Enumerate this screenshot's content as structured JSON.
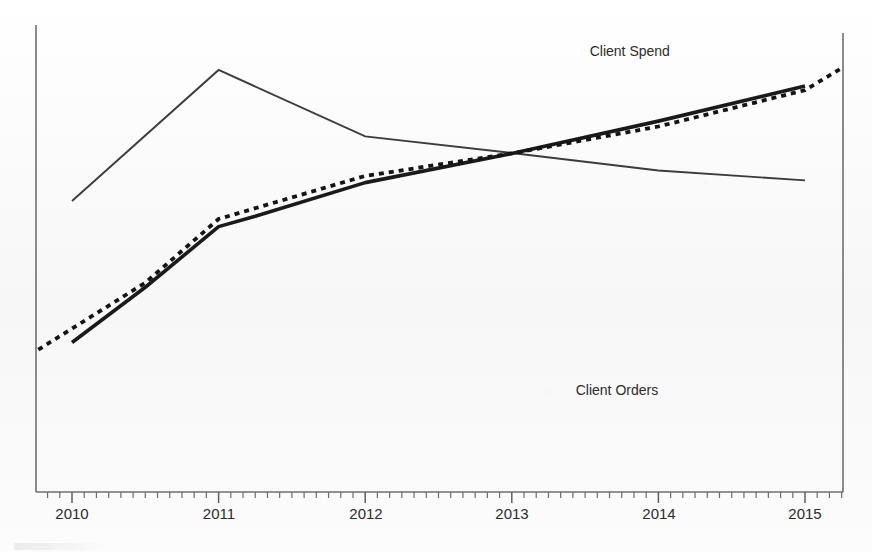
{
  "chart_data": {
    "type": "line",
    "title": "",
    "subtitle": "",
    "xlabel": "",
    "ylabel": "",
    "xlim": [
      2009.77,
      2015.26
    ],
    "ylim": [
      0,
      100
    ],
    "grid": false,
    "legend_position": "inline-end-of-line",
    "x_tick_labels": [
      "2010",
      "2011",
      "2012",
      "2013",
      "2014",
      "2015"
    ],
    "x_ticks": [
      2010,
      2011,
      2012,
      2013,
      2014,
      2015
    ],
    "x_minor_ticks_per_interval": 12,
    "y_tick_labels": [],
    "series": [
      {
        "name": "Client Orders",
        "style": "thin-solid",
        "color": "#3c3c3c",
        "label_text": "Client Orders",
        "label_x": 2014.05,
        "label_y": 21.5,
        "x": [
          2010.0,
          2011.0,
          2012.0,
          2013.0,
          2014.0,
          2015.0
        ],
        "values": [
          64.8,
          94.0,
          79.2,
          75.5,
          71.6,
          69.4
        ]
      },
      {
        "name": "Client Spend",
        "style": "thick-solid",
        "color": "#1a1a1a",
        "label_text": "Client Spend",
        "label_x": 2014.2,
        "label_y": 97.0,
        "x": [
          2010.0,
          2010.5,
          2011.0,
          2011.25,
          2012.0,
          2013.0,
          2014.0,
          2015.0
        ],
        "values": [
          33.3,
          45.6,
          59.1,
          61.4,
          68.9,
          75.4,
          82.6,
          90.4
        ]
      },
      {
        "name": "Trend (dotted)",
        "style": "dotted",
        "color": "#141414",
        "label_text": "",
        "x": [
          2009.77,
          2010.5,
          2011.0,
          2012.0,
          2013.0,
          2014.0,
          2015.0,
          2015.26
        ],
        "values": [
          31.7,
          46.6,
          60.8,
          70.4,
          75.4,
          81.4,
          89.5,
          94.6
        ]
      }
    ],
    "annotations": [
      {
        "text": "Client Spend",
        "x": 2014.2,
        "y": 97.0
      },
      {
        "text": "Client Orders",
        "x": 2014.05,
        "y": 21.5
      }
    ]
  },
  "axes": {
    "x_axis_name": "year-axis",
    "y_axis_name": "value-axis",
    "left_spine_visible": true,
    "bottom_spine_visible": true,
    "right_spine_visible": true,
    "top_spine_visible": false
  },
  "tick_labels": {
    "t0": "2010",
    "t1": "2011",
    "t2": "2012",
    "t3": "2013",
    "t4": "2014",
    "t5": "2015"
  },
  "labels": {
    "client_spend": "Client Spend",
    "client_orders": "Client Orders"
  },
  "colors": {
    "background": "#fbfbfb",
    "axis": "#6f6f6f",
    "thin_line": "#3c3c3c",
    "thick_line": "#1a1a1a",
    "dotted_line": "#141414",
    "text": "#2b2b2b"
  }
}
